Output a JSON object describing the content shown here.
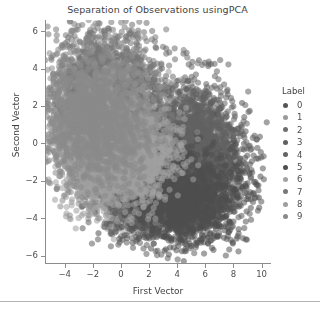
{
  "chart_data": {
    "type": "scatter",
    "title": "Separation of Observations usingPCA",
    "xlabel": "First Vector",
    "ylabel": "Second Vector",
    "xlim": [
      -5.4,
      10.6
    ],
    "ylim": [
      -6.4,
      6.6
    ],
    "xticks": [
      -4,
      -2,
      0,
      2,
      4,
      6,
      8,
      10
    ],
    "xtick_labels": [
      "−4",
      "−2",
      "0",
      "2",
      "4",
      "6",
      "8",
      "10"
    ],
    "yticks": [
      -6,
      -4,
      -2,
      0,
      2,
      4,
      6
    ],
    "ytick_labels": [
      "−6",
      "−4",
      "−2",
      "0",
      "2",
      "4",
      "6"
    ],
    "grid": false,
    "legend_position": "right",
    "legend_title": "Label",
    "marker_size": 3.1,
    "marker_opacity": 0.55,
    "series": [
      {
        "name": "0",
        "label": "0",
        "color": "#555555",
        "n": 1300,
        "center": [
          5.9,
          -1.6
        ],
        "spread": [
          1.75,
          1.5
        ],
        "rotation": -0.25
      },
      {
        "name": "1",
        "label": "1",
        "color": "#9a9a9a",
        "n": 1500,
        "center": [
          1.2,
          -1.9
        ],
        "spread": [
          1.7,
          0.95
        ],
        "rotation": 0.12
      },
      {
        "name": "2",
        "label": "2",
        "color": "#6e6e6e",
        "n": 1350,
        "center": [
          -0.5,
          1.9
        ],
        "spread": [
          1.9,
          1.7
        ],
        "rotation": 0.3
      },
      {
        "name": "3",
        "label": "3",
        "color": "#5f5f5f",
        "n": 1350,
        "center": [
          2.6,
          -3.1
        ],
        "spread": [
          1.85,
          1.0
        ],
        "rotation": 0.05
      },
      {
        "name": "4",
        "label": "4",
        "color": "#636363",
        "n": 1300,
        "center": [
          4.9,
          0.2
        ],
        "spread": [
          1.6,
          1.6
        ],
        "rotation": -0.2
      },
      {
        "name": "5",
        "label": "5",
        "color": "#4f4f4f",
        "n": 1250,
        "center": [
          4.3,
          -2.9
        ],
        "spread": [
          1.9,
          1.2
        ],
        "rotation": -0.1
      },
      {
        "name": "6",
        "label": "6",
        "color": "#a3a3a3",
        "n": 1300,
        "center": [
          0.2,
          -1.0
        ],
        "spread": [
          1.8,
          1.15
        ],
        "rotation": 0.18
      },
      {
        "name": "7",
        "label": "7",
        "color": "#787878",
        "n": 1400,
        "center": [
          -1.4,
          2.6
        ],
        "spread": [
          1.8,
          1.6
        ],
        "rotation": 0.22
      },
      {
        "name": "8",
        "label": "8",
        "color": "#9e9e9e",
        "n": 1300,
        "center": [
          -1.0,
          0.4
        ],
        "spread": [
          1.85,
          1.55
        ],
        "rotation": 0.15
      },
      {
        "name": "9",
        "label": "9",
        "color": "#8a8a8a",
        "n": 1400,
        "center": [
          -1.8,
          1.2
        ],
        "spread": [
          1.9,
          1.8
        ],
        "rotation": 0.1
      }
    ]
  },
  "legend": {
    "title": "Label",
    "items": [
      {
        "label": "0",
        "color": "#555555"
      },
      {
        "label": "1",
        "color": "#9a9a9a"
      },
      {
        "label": "2",
        "color": "#6e6e6e"
      },
      {
        "label": "3",
        "color": "#5f5f5f"
      },
      {
        "label": "4",
        "color": "#636363"
      },
      {
        "label": "5",
        "color": "#4f4f4f"
      },
      {
        "label": "6",
        "color": "#a3a3a3"
      },
      {
        "label": "7",
        "color": "#787878"
      },
      {
        "label": "8",
        "color": "#9e9e9e"
      },
      {
        "label": "9",
        "color": "#8a8a8a"
      }
    ]
  },
  "style": {
    "axis_color": "#8c8c8c",
    "text_color": "#4d4d4d",
    "title_color": "#3f3f3f",
    "background": "#ffffff",
    "divider_color": "#b4b4b4"
  }
}
